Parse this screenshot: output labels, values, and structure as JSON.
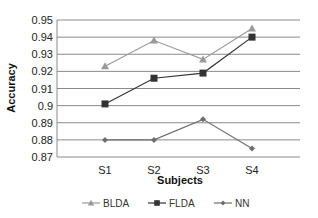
{
  "chart_data": {
    "type": "line",
    "title": "",
    "xlabel": "Subjects",
    "ylabel": "Accuracy",
    "categories": [
      "S1",
      "S2",
      "S3",
      "S4"
    ],
    "ylim": [
      0.87,
      0.95
    ],
    "yticks": [
      "0.87",
      "0.88",
      "0.89",
      "0.9",
      "0.91",
      "0.92",
      "0.93",
      "0.94",
      "0.95"
    ],
    "grid": true,
    "legend_position": "bottom",
    "series": [
      {
        "name": "BLDA",
        "values": [
          0.923,
          0.938,
          0.927,
          0.945
        ],
        "color": "#9a9a9a",
        "marker": "triangle"
      },
      {
        "name": "FLDA",
        "values": [
          0.901,
          0.916,
          0.919,
          0.94
        ],
        "color": "#333333",
        "marker": "square"
      },
      {
        "name": "NN",
        "values": [
          0.88,
          0.88,
          0.892,
          0.875
        ],
        "color": "#6e6e6e",
        "marker": "diamond"
      }
    ]
  }
}
